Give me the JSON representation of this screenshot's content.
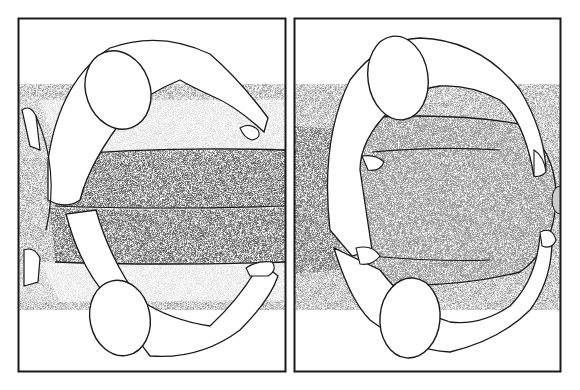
{
  "figure": {
    "panel_count": 2,
    "style": "black and white stipple illustration",
    "colors": {
      "ink": "#1a1a1a",
      "paper": "#ffffff",
      "stipple_dark": "#6a6a6a",
      "stipple_mid": "#9a9a9a",
      "stipple_light": "#c8c8c8"
    },
    "panels": [
      {
        "id": "left",
        "subject": "practitioner at head and foot of table, hands on legs of reclining figure"
      },
      {
        "id": "right",
        "subject": "practitioner at head and foot of table, hands on torso of reclining figure"
      }
    ]
  }
}
